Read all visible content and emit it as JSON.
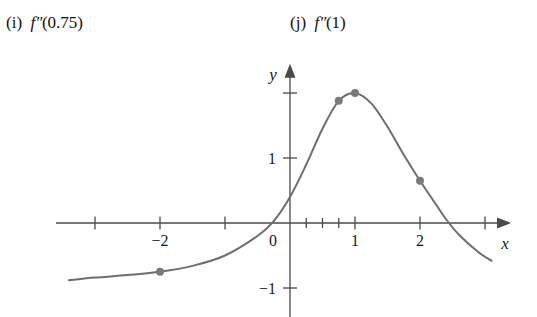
{
  "problem_labels": [
    {
      "name": "label-i",
      "enumerator": "(i)",
      "function": "f",
      "primes": "″",
      "argument": "(0.75)"
    },
    {
      "name": "label-j",
      "enumerator": "(j)",
      "function": "f",
      "primes": "″",
      "argument": "(1)"
    }
  ],
  "colors": {
    "curve": "#6e6e6e",
    "axis": "#4a4a4a",
    "point": "#7a7a7a",
    "text": "#1a1a1a",
    "background": "#ffffff"
  },
  "chart_data": {
    "type": "line",
    "title": "",
    "xlabel": "x",
    "ylabel": "y",
    "xlim": [
      -3.6,
      3.4
    ],
    "ylim": [
      -1.45,
      2.45
    ],
    "grid": false,
    "legend": null,
    "axes": {
      "x_axis_label": "x",
      "y_axis_label": "y",
      "x_ticks": [
        -3,
        -2,
        -1,
        0.25,
        0.5,
        0.75,
        1,
        2,
        3
      ],
      "x_tick_labels": [
        {
          "value": -2,
          "text": "−2"
        },
        {
          "value": 0,
          "text": "0"
        },
        {
          "value": 1,
          "text": "1"
        },
        {
          "value": 2,
          "text": "2"
        }
      ],
      "y_ticks": [
        -1,
        1,
        2
      ],
      "y_tick_labels": [
        {
          "value": 1,
          "text": "1"
        },
        {
          "value": -1,
          "text": "−1"
        }
      ]
    },
    "series": [
      {
        "name": "f",
        "kind": "curve",
        "x": [
          -3.4,
          -3.0,
          -2.5,
          -2.0,
          -1.5,
          -1.0,
          -0.5,
          -0.25,
          0.0,
          0.25,
          0.5,
          0.75,
          1.0,
          1.25,
          1.5,
          1.75,
          2.0,
          2.25,
          2.4,
          2.6,
          2.9,
          3.1
        ],
        "y": [
          -0.88,
          -0.84,
          -0.8,
          -0.75,
          -0.66,
          -0.5,
          -0.2,
          0.03,
          0.4,
          0.9,
          1.45,
          1.88,
          2.0,
          1.84,
          1.48,
          1.05,
          0.65,
          0.28,
          0.06,
          -0.18,
          -0.45,
          -0.58
        ]
      }
    ],
    "points": [
      {
        "label": "",
        "x": -2.0,
        "y": -0.75
      },
      {
        "label": "",
        "x": 0.75,
        "y": 1.88
      },
      {
        "label": "",
        "x": 1.0,
        "y": 2.0
      },
      {
        "label": "",
        "x": 2.0,
        "y": 0.65
      }
    ]
  }
}
